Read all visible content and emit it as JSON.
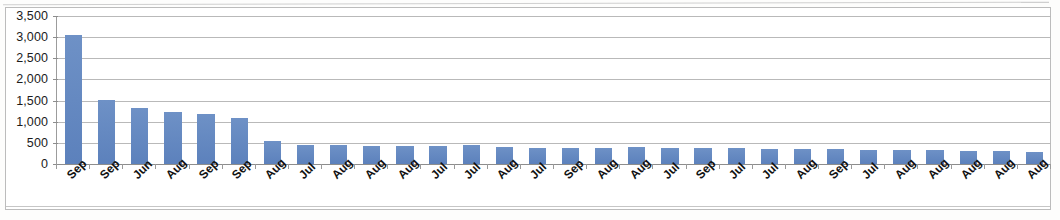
{
  "chart_data": {
    "type": "bar",
    "title": "",
    "subtitle": "",
    "xlabel": "",
    "ylabel": "",
    "ylim": [
      0,
      3500
    ],
    "ytick_values": [
      0,
      500,
      1000,
      1500,
      2000,
      2500,
      3000,
      3500
    ],
    "ytick_labels": [
      "0",
      "500",
      "1,000",
      "1,500",
      "2,000",
      "2,500",
      "3,000",
      "3,500"
    ],
    "grid": true,
    "legend": false,
    "legend_position": "none",
    "bar_color": "#6288c0",
    "categories": [
      "Sep",
      "Sep",
      "Jun",
      "Aug",
      "Sep",
      "Sep",
      "Aug",
      "Jul",
      "Aug",
      "Aug",
      "Aug",
      "Jul",
      "Jul",
      "Aug",
      "Jul",
      "Sep",
      "Aug",
      "Aug",
      "Jul",
      "Sep",
      "Jul",
      "Jul",
      "Aug",
      "Sep",
      "Jul",
      "Aug",
      "Aug",
      "Aug",
      "Aug",
      "Aug"
    ],
    "values": [
      3050,
      1520,
      1320,
      1230,
      1180,
      1080,
      540,
      450,
      450,
      420,
      420,
      420,
      440,
      400,
      390,
      390,
      390,
      400,
      380,
      370,
      370,
      360,
      350,
      350,
      340,
      330,
      320,
      300,
      300,
      290
    ]
  },
  "axis": {
    "y_max_label": "3,500",
    "y_min_label": "0"
  }
}
